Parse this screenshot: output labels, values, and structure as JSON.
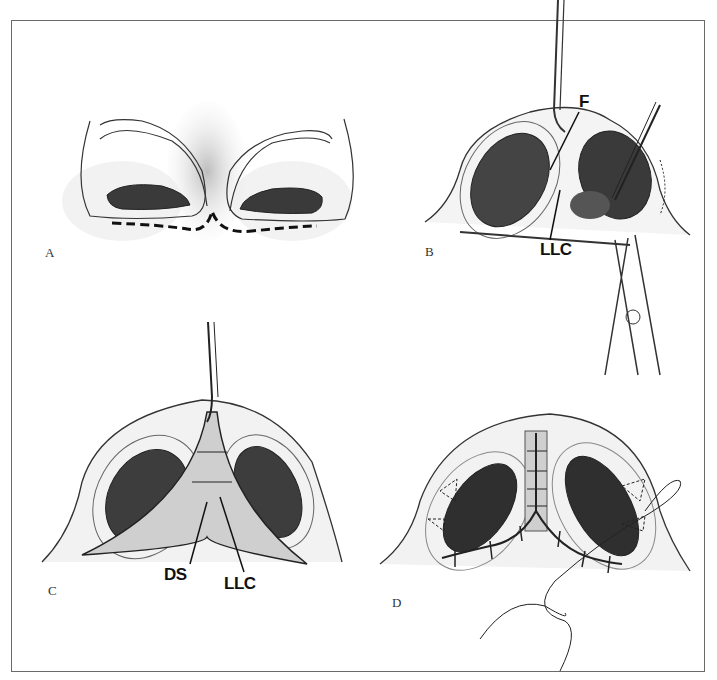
{
  "figure": {
    "panels": [
      {
        "id": "A",
        "letter": "A",
        "description": "Basal view of nose with dashed incision line along nostril bases"
      },
      {
        "id": "B",
        "letter": "B",
        "description": "Open approach with retraction; lower lateral cartilage exposed",
        "labels": {
          "f": "F",
          "llc": "LLC"
        }
      },
      {
        "id": "C",
        "letter": "C",
        "description": "Columella flap elevated exposing cartilages",
        "labels": {
          "ds": "DS",
          "llc": "LLC"
        }
      },
      {
        "id": "D",
        "letter": "D",
        "description": "Closure with interrupted sutures and running suture"
      }
    ],
    "colors": {
      "line": "#222222",
      "shade": "#9a9a9a",
      "border": "#6a6a6a",
      "background": "#ffffff"
    }
  }
}
